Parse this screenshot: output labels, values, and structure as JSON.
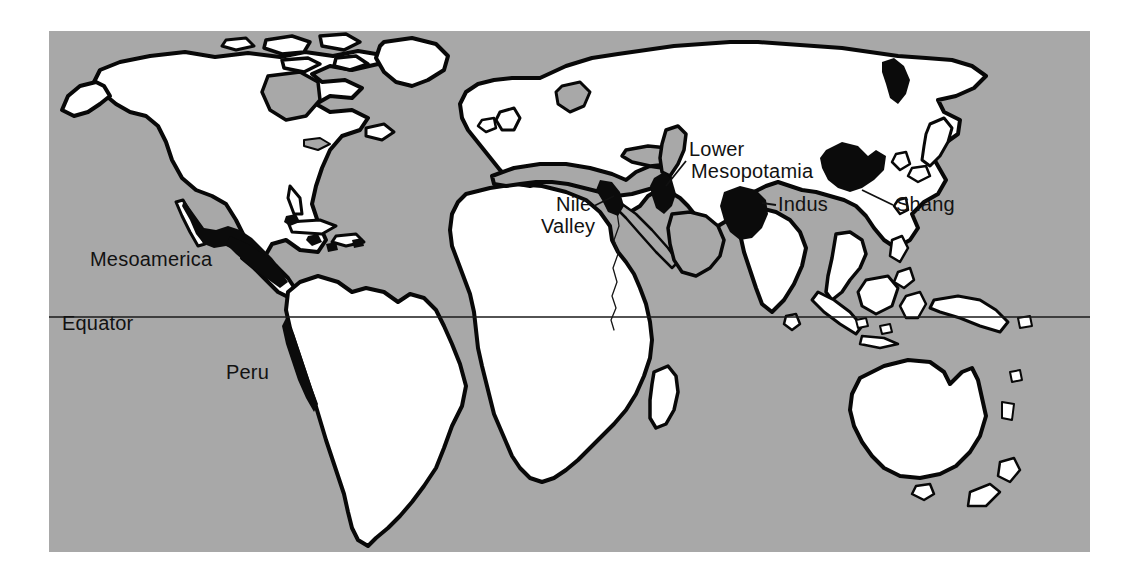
{
  "figure": {
    "type": "map",
    "background_color": "#ffffff"
  },
  "map": {
    "frame": {
      "x": 49,
      "y": 31,
      "width": 1041,
      "height": 521
    },
    "ocean_color": "#a8a8a8",
    "land_color": "#ffffff",
    "civilization_color": "#0b0b0b",
    "coastline_color": "#080808",
    "projection_note": "equirectangular world map, land white, sea gray"
  },
  "equator": {
    "label": "Equator",
    "label_x": 62,
    "label_y": 330,
    "line_y": 317,
    "line_x1": 49,
    "line_x2": 1090
  },
  "civilizations": [
    {
      "id": "mesoamerica",
      "label": "Mesoamerica",
      "label_x": 90,
      "label_y": 266,
      "has_leader": false,
      "region": "Mexico and Central America"
    },
    {
      "id": "peru",
      "label": "Peru",
      "label_x": 226,
      "label_y": 379,
      "has_leader": false,
      "region": "Andean coast of South America"
    },
    {
      "id": "nile-valley",
      "label": "Nile Valley",
      "label_line_1": "Nile",
      "label_line_2": "Valley",
      "label_x": 556,
      "label_y": 211,
      "has_leader": true,
      "region": "Lower Egypt and the Nile"
    },
    {
      "id": "lower-mesopotamia",
      "label": "Lower Mesopotamia",
      "label_line_1": "Lower",
      "label_line_2": "Mesopotamia",
      "label_x": 688,
      "label_y": 156,
      "has_leader": true,
      "region": "Tigris-Euphrates delta"
    },
    {
      "id": "indus",
      "label": "Indus",
      "label_x": 778,
      "label_y": 211,
      "has_leader": true,
      "region": "Indus River valley"
    },
    {
      "id": "shang",
      "label": "Shang",
      "label_x": 896,
      "label_y": 211,
      "has_leader": true,
      "region": "Yellow River, northern China"
    }
  ],
  "label_font_size_px": 20
}
